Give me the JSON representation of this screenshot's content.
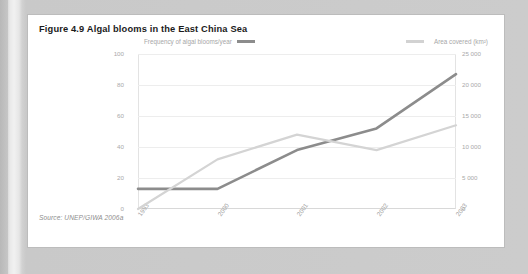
{
  "page": {
    "background_color": "#c9c9c9",
    "card_color": "#ffffff"
  },
  "figure": {
    "title": "Figure 4.9 Algal blooms in the East China Sea",
    "source": "Source: UNEP/GIWA 2006a"
  },
  "chart_data": {
    "type": "line",
    "title": "Figure 4.9 Algal blooms in the East China Sea",
    "xlabel": "",
    "ylabel": "Frequency of algal blooms/year",
    "y2label": "Area covered (km²)",
    "categories": [
      "1993",
      "2000",
      "2001",
      "2002",
      "2003"
    ],
    "series": [
      {
        "name": "Frequency of algal blooms/year",
        "axis": "left",
        "color": "#8c8c8c",
        "values": [
          13,
          13,
          38,
          52,
          87
        ]
      },
      {
        "name": "Area covered (km²)",
        "axis": "right",
        "color": "#d4d4d4",
        "values": [
          0,
          8000,
          12000,
          9500,
          13500
        ]
      }
    ],
    "ylim": [
      0,
      100
    ],
    "yticks": [
      "0",
      "20",
      "40",
      "60",
      "80",
      "100"
    ],
    "y2lim": [
      0,
      25000
    ],
    "y2ticks": [
      "0",
      "5 000",
      "10 000",
      "15 000",
      "20 000",
      "25 000"
    ],
    "grid": true,
    "legend_position": "top"
  },
  "legend": {
    "frequency_label": "Frequency of algal blooms/year",
    "area_label": "Area covered (km²)"
  }
}
